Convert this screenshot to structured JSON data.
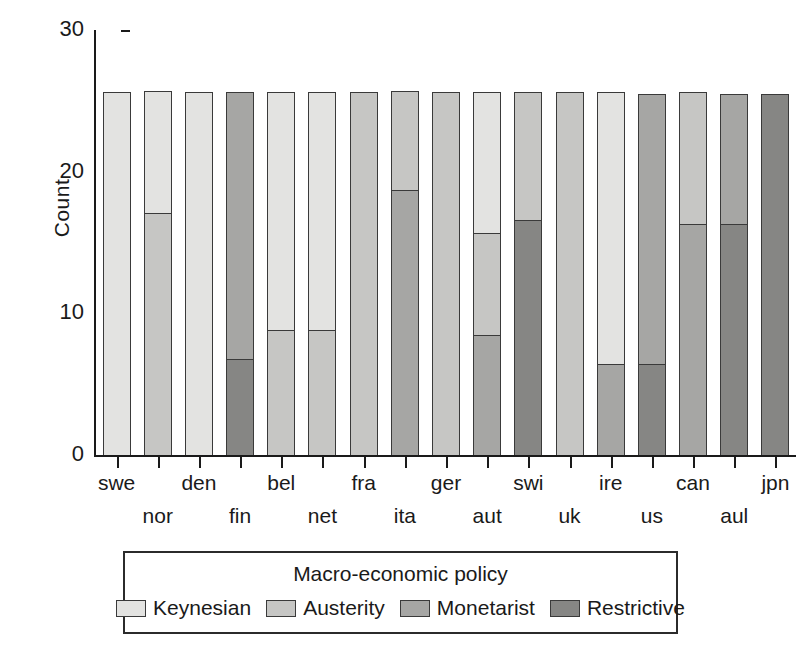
{
  "chart_data": {
    "type": "bar",
    "stacked": true,
    "title": "",
    "xlabel": "",
    "ylabel": "Count",
    "ylim": [
      0,
      30
    ],
    "yticks": [
      0,
      10,
      20,
      30
    ],
    "ytick_labels": [
      "0",
      "10",
      "20",
      "30"
    ],
    "grid": false,
    "legend_position": "bottom",
    "legend_title": "Macro-economic policy",
    "categories": [
      "swe",
      "nor",
      "den",
      "fin",
      "bel",
      "net",
      "fra",
      "ita",
      "ger",
      "aut",
      "swi",
      "uk",
      "ire",
      "us",
      "can",
      "aul",
      "jpn"
    ],
    "series": [
      {
        "name": "Keynesian",
        "color": "#e3e3e1",
        "values": [
          25.6,
          8.6,
          25.6,
          0,
          16.8,
          16.8,
          0,
          0,
          0,
          9.9,
          0,
          0,
          19.2,
          0,
          0,
          0,
          0
        ]
      },
      {
        "name": "Austerity",
        "color": "#c6c6c4",
        "values": [
          0,
          17.1,
          0,
          0,
          8.8,
          8.8,
          25.6,
          7.0,
          25.6,
          7.2,
          9.0,
          25.6,
          0,
          0,
          9.3,
          0,
          0
        ]
      },
      {
        "name": "Monetarist",
        "color": "#a6a6a4",
        "values": [
          0,
          0,
          0,
          18.8,
          0,
          0,
          0,
          18.7,
          0,
          8.5,
          0,
          0,
          6.4,
          19.1,
          16.3,
          9.2,
          0
        ]
      },
      {
        "name": "Restrictive",
        "color": "#868684",
        "values": [
          0,
          0,
          0,
          6.8,
          0,
          0,
          0,
          0,
          0,
          0,
          16.6,
          0,
          0,
          6.4,
          0,
          16.3,
          25.5
        ]
      }
    ]
  },
  "axis": {
    "y_label": "Count",
    "y_ticks": [
      "30",
      "20",
      "10",
      "0"
    ]
  },
  "legend": {
    "title": "Macro-economic policy",
    "entries": [
      {
        "label": "Keynesian",
        "color": "#e3e3e1"
      },
      {
        "label": "Austerity",
        "color": "#c6c6c4"
      },
      {
        "label": "Monetarist",
        "color": "#a6a6a4"
      },
      {
        "label": "Restrictive",
        "color": "#868684"
      }
    ]
  }
}
